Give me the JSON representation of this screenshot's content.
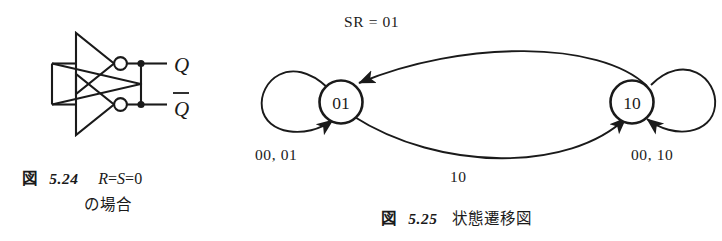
{
  "figure_524": {
    "caption": {
      "label": "図",
      "number": "5.24",
      "math_r": "R",
      "math_eq1": "=",
      "math_s": "S",
      "math_eq2": "=",
      "math_zero": "0",
      "line2": "の場合"
    },
    "circuit": {
      "type": "cross-coupled-inverter-latch",
      "inverter_count": 2,
      "output_labels": [
        {
          "name": "q-output-label",
          "text": "Q",
          "overbar": false
        },
        {
          "name": "qbar-output-label",
          "text": "Q",
          "overbar": true
        }
      ]
    }
  },
  "figure_525": {
    "caption": {
      "label": "図",
      "number": "5.25",
      "text": "状態遷移図"
    },
    "diagram": {
      "type": "state-transition-diagram",
      "states": [
        {
          "id": "01",
          "label": "01"
        },
        {
          "id": "10",
          "label": "10"
        }
      ],
      "transitions": [
        {
          "from": "10",
          "to": "01",
          "label": "SR = 01"
        },
        {
          "from": "01",
          "to": "10",
          "label": "10"
        },
        {
          "from": "01",
          "to": "01",
          "label": "00, 01"
        },
        {
          "from": "10",
          "to": "10",
          "label": "00, 10"
        }
      ],
      "labels": {
        "top": "SR = 01",
        "bottom": "10",
        "left_selfloop": "00, 01",
        "right_selfloop": "00, 10"
      }
    }
  },
  "colors": {
    "ink": "#1a1a1a",
    "background": "#ffffff"
  }
}
